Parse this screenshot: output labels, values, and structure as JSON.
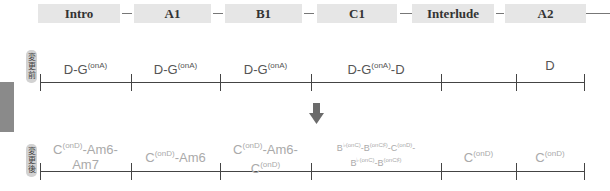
{
  "sections": [
    {
      "label": "Intro"
    },
    {
      "label": "A1"
    },
    {
      "label": "B1"
    },
    {
      "label": "C1"
    },
    {
      "label": "Interlude"
    },
    {
      "label": "A2"
    }
  ],
  "before": {
    "label_chars": [
      "変",
      "更",
      "前"
    ],
    "chords": [
      {
        "base": "D-G",
        "sup": "(onA)",
        "tail": ""
      },
      {
        "base": "D-G",
        "sup": "(onA)",
        "tail": ""
      },
      {
        "base": "D-G",
        "sup": "(onA)",
        "tail": ""
      },
      {
        "base": "D-G",
        "sup": "(onA)",
        "tail": "-D"
      },
      {
        "base": "",
        "sup": "",
        "tail": ""
      },
      {
        "base": "D",
        "sup": "",
        "tail": ""
      }
    ]
  },
  "after": {
    "label_chars": [
      "変",
      "更",
      "後"
    ],
    "chords": [
      {
        "line1": {
          "a": "C",
          "s": "(onD)",
          "b": "-Am6-"
        },
        "line2": {
          "a": "Am7",
          "s": "",
          "b": ""
        }
      },
      {
        "line1": {
          "a": "C",
          "s": "(onD)",
          "b": "-Am6"
        }
      },
      {
        "line1": {
          "a": "C",
          "s": "(onD)",
          "b": "-Am6-"
        },
        "line2": {
          "a": "C",
          "s": "(onD)",
          "b": ""
        }
      },
      {
        "line1": {
          "a": "B",
          "s": "♭(onC)",
          "b": "-B",
          "s2": "(onC♯)",
          "c": "-C",
          "s3": "(onD)",
          "d": "-"
        },
        "line2": {
          "a": "B",
          "s": "♭(onC)",
          "b": "-B",
          "s2": "(onC♯)"
        }
      },
      {
        "line1": {
          "a": "C",
          "s": "(onD)",
          "b": ""
        }
      },
      {
        "line1": {
          "a": "C",
          "s": "(onD)",
          "b": ""
        }
      }
    ]
  },
  "arrow": {
    "direction": "down",
    "color": "#6b6b6b"
  },
  "colors": {
    "section_bg": "#e6e6e6",
    "line": "#444444",
    "before_text": "#555555",
    "after_text": "#aaaaaa",
    "side_tab": "#8a8a8a"
  }
}
